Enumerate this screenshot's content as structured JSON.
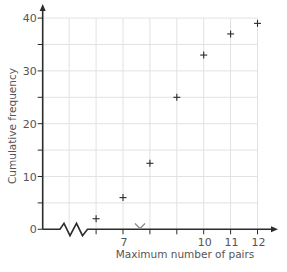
{
  "chart_data": {
    "type": "scatter",
    "title": "",
    "xlabel": "Maximum number of pairs",
    "ylabel": "Cumulative frequency",
    "x": [
      6,
      7,
      8,
      9,
      10,
      11,
      12
    ],
    "values": [
      2,
      6,
      12.5,
      25,
      33,
      37,
      39
    ],
    "series": [
      {
        "name": "Cumulative frequency",
        "marker": "+",
        "x": [
          6,
          7,
          8,
          9,
          10,
          11,
          12
        ],
        "values": [
          2,
          6,
          12.5,
          25,
          33,
          37,
          39
        ]
      }
    ],
    "xlim": [
      4,
      12
    ],
    "ylim": [
      0,
      40
    ],
    "x_ticks": [
      6,
      7,
      8,
      9,
      10,
      11,
      12
    ],
    "x_tick_labels": [
      {
        "value": 7,
        "label": "7"
      },
      {
        "value": 10,
        "label": "10"
      },
      {
        "value": 11,
        "label": "11"
      },
      {
        "value": 12,
        "label": "12"
      }
    ],
    "y_ticks": [
      0,
      5,
      10,
      15,
      20,
      25,
      30,
      35,
      40
    ],
    "y_tick_labels": [
      {
        "value": 0,
        "label": "0"
      },
      {
        "value": 10,
        "label": "10"
      },
      {
        "value": 20,
        "label": "20"
      },
      {
        "value": 30,
        "label": "30"
      },
      {
        "value": 40,
        "label": "40"
      }
    ],
    "grid": true,
    "x_axis_break": true,
    "legend": "none",
    "colors": {
      "axis": "#2b2b2b",
      "grid": "#e2e2e2",
      "text": "#555555",
      "marker": "#2b2b2b"
    }
  }
}
